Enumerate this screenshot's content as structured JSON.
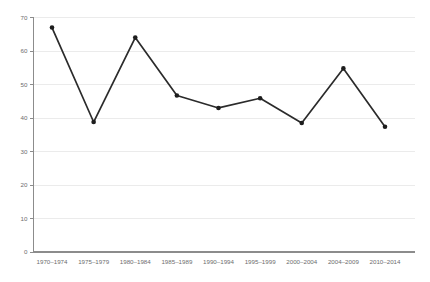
{
  "chart_data": {
    "type": "line",
    "title": "",
    "subtitle": "",
    "xlabel": "",
    "ylabel": "",
    "categories": [
      "1970–1974",
      "1975–1979",
      "1980–1984",
      "1985–1989",
      "1990–1994",
      "1995–1999",
      "2000–2004",
      "2004–2009",
      "2010–2014"
    ],
    "values": [
      67,
      38.8,
      64,
      46.7,
      43,
      45.9,
      38.5,
      54.8,
      37.4
    ],
    "series": [
      {
        "name": "",
        "values": [
          67,
          38.8,
          64,
          46.7,
          43,
          45.9,
          38.5,
          54.8,
          37.4
        ]
      }
    ],
    "ylim": [
      0,
      70
    ],
    "yticks": [
      0,
      10,
      20,
      30,
      40,
      50,
      60,
      70
    ],
    "ytick_labels": [
      "0",
      "10",
      "20",
      "30",
      "40",
      "50",
      "60",
      "70"
    ],
    "grid": true,
    "grid_axis": "y",
    "legend": false,
    "legend_position": "none",
    "marker": "circle",
    "annotations": [],
    "colors": {
      "background": "#ffffff",
      "gridline": "#ebebeb",
      "axis": "#8c8c8c",
      "line": "#2b2b2b",
      "marker": "#1d1d1d",
      "tick_label": "#6d6d6d"
    }
  }
}
